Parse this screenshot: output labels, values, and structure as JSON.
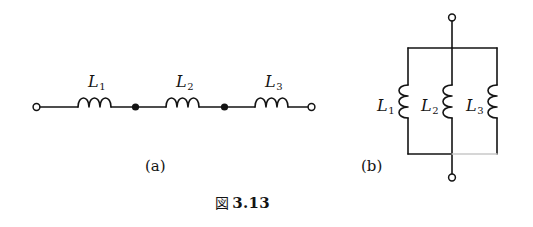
{
  "figure": {
    "caption_mark": "図",
    "caption_number": "3.13",
    "background_color": "#ffffff",
    "ink_color": "#141414",
    "faint_ink_color": "#c9c9c9"
  },
  "panels": [
    {
      "id": "a",
      "sub_caption": "(a)",
      "topology": "series",
      "terminals": [
        "open-circle-left",
        "open-circle-right"
      ],
      "junction_dots": 2,
      "inductors": [
        {
          "symbol": "L",
          "subscript": "1",
          "label": "L₁",
          "coil_loops": 3
        },
        {
          "symbol": "L",
          "subscript": "2",
          "label": "L₂",
          "coil_loops": 3
        },
        {
          "symbol": "L",
          "subscript": "3",
          "label": "L₃",
          "coil_loops": 3
        }
      ]
    },
    {
      "id": "b",
      "sub_caption": "(b)",
      "topology": "parallel",
      "terminals": [
        "open-circle-top",
        "open-circle-bottom"
      ],
      "junction_dots": 0,
      "inductors": [
        {
          "symbol": "L",
          "subscript": "1",
          "label": "L₁",
          "coil_loops": 3
        },
        {
          "symbol": "L",
          "subscript": "2",
          "label": "L₂",
          "coil_loops": 3
        },
        {
          "symbol": "L",
          "subscript": "3",
          "label": "L₃",
          "coil_loops": 3
        }
      ]
    }
  ],
  "labels": {
    "a_L1": "L",
    "a_L1_sub": "1",
    "a_L2": "L",
    "a_L2_sub": "2",
    "a_L3": "L",
    "a_L3_sub": "3",
    "b_L1": "L",
    "b_L1_sub": "1",
    "b_L2": "L",
    "b_L2_sub": "2",
    "b_L3": "L",
    "b_L3_sub": "3",
    "caption_a": "(a)",
    "caption_b": "(b)"
  }
}
